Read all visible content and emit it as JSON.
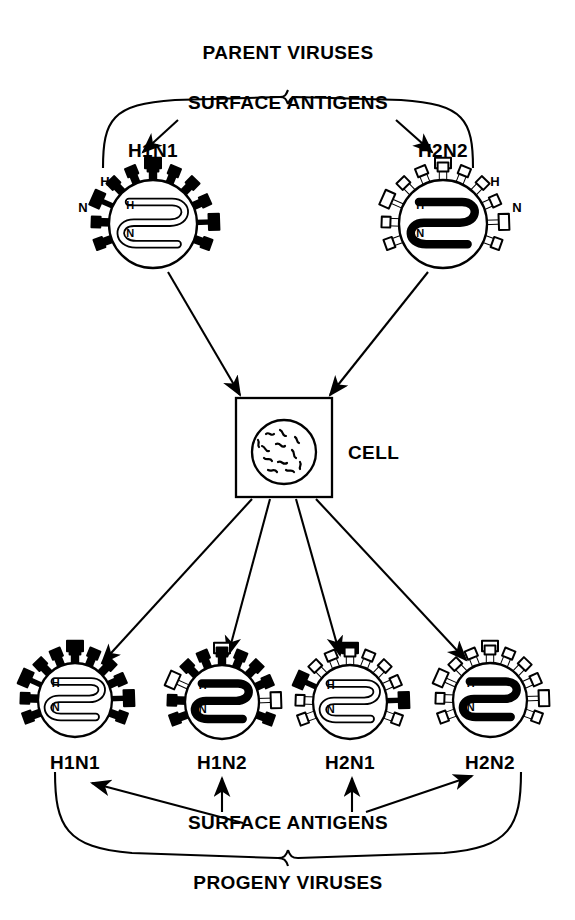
{
  "diagram": {
    "title_top": "PARENT VIRUSES",
    "title_bottom": "PROGENY VIRUSES",
    "antigen_label_top": "SURFACE ANTIGENS",
    "antigen_label_bottom": "SURFACE ANTIGENS",
    "cell_label": "CELL",
    "colors": {
      "ink": "#000000",
      "paper": "#ffffff"
    },
    "spike_glyphs": {
      "hemagglutinin": "rod-spike",
      "neuraminidase": "mushroom-spike"
    },
    "antigen_keys": {
      "h": "H",
      "n": "N"
    }
  },
  "parents": [
    {
      "name": "H1N1",
      "spike_fill": "solid",
      "genome_fill": "hollow",
      "cx": 153,
      "cy": 224,
      "label_x": 153,
      "label_y": 140
    },
    {
      "name": "H2N2",
      "spike_fill": "hollow",
      "genome_fill": "solid",
      "cx": 443,
      "cy": 224,
      "label_x": 443,
      "label_y": 140
    }
  ],
  "progeny": [
    {
      "name": "H1N1",
      "h_spike_fill": "solid",
      "n_spike_fill": "solid",
      "genome_fill": "hollow",
      "cx": 75,
      "cy": 700,
      "label_x": 75,
      "label_y": 752
    },
    {
      "name": "H1N2",
      "h_spike_fill": "solid",
      "n_spike_fill": "hollow",
      "genome_fill": "solid",
      "cx": 222,
      "cy": 702,
      "label_x": 222,
      "label_y": 752
    },
    {
      "name": "H2N1",
      "h_spike_fill": "hollow",
      "n_spike_fill": "solid",
      "genome_fill": "hollow",
      "cx": 350,
      "cy": 702,
      "label_x": 350,
      "label_y": 752
    },
    {
      "name": "H2N2",
      "h_spike_fill": "hollow",
      "n_spike_fill": "hollow",
      "genome_fill": "solid",
      "cx": 490,
      "cy": 700,
      "label_x": 490,
      "label_y": 752
    }
  ],
  "cell": {
    "x": 236,
    "y": 398,
    "w": 96,
    "h": 99,
    "nucleus_cx": 284,
    "nucleus_cy": 452,
    "nucleus_r": 32,
    "label_x": 348,
    "label_y": 452
  }
}
